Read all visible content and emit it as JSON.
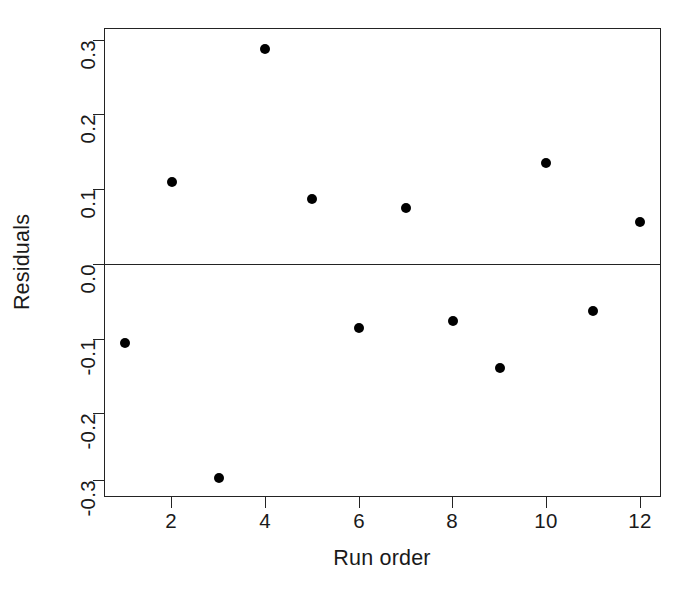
{
  "chart_data": {
    "type": "scatter",
    "title": "",
    "xlabel": "Run order",
    "ylabel": "Residuals",
    "x": [
      1,
      2,
      3,
      4,
      5,
      6,
      7,
      8,
      9,
      10,
      11,
      12
    ],
    "values": [
      -0.112,
      0.112,
      -0.3,
      0.298,
      0.089,
      -0.092,
      0.076,
      -0.082,
      -0.147,
      0.139,
      -0.067,
      0.057
    ],
    "xlim": [
      0.55,
      12.45
    ],
    "ylim": [
      -0.327,
      0.327
    ],
    "xticks": [
      2,
      4,
      6,
      8,
      10,
      12
    ],
    "xtick_labels": [
      "2",
      "4",
      "6",
      "8",
      "10",
      "12"
    ],
    "yticks": [
      -0.3,
      -0.2,
      -0.1,
      0.0,
      0.1,
      0.2,
      0.3
    ],
    "ytick_labels": [
      "-0.3",
      "-0.2",
      "-0.1",
      "0.0",
      "0.1",
      "0.2",
      "0.3"
    ],
    "grid": false,
    "legend": null,
    "reference_lines": [
      {
        "axis": "y",
        "value": 0.0
      }
    ],
    "marker": {
      "shape": "circle",
      "filled": true,
      "color": "#000000",
      "size": 10
    },
    "axis_color": "#232323",
    "background": "#ffffff"
  }
}
